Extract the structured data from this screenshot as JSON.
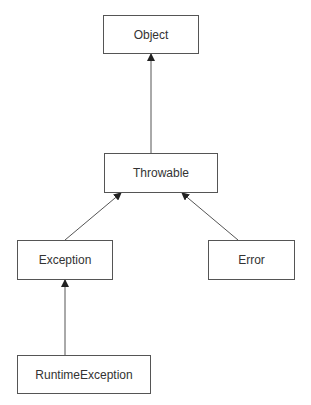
{
  "diagram": {
    "type": "class-hierarchy",
    "nodes": [
      {
        "id": "object",
        "label": "Object"
      },
      {
        "id": "throwable",
        "label": "Throwable"
      },
      {
        "id": "exception",
        "label": "Exception"
      },
      {
        "id": "error",
        "label": "Error"
      },
      {
        "id": "runtime",
        "label": "RuntimeException"
      }
    ],
    "edges": [
      {
        "from": "throwable",
        "to": "object",
        "kind": "inherits"
      },
      {
        "from": "exception",
        "to": "throwable",
        "kind": "inherits"
      },
      {
        "from": "error",
        "to": "throwable",
        "kind": "inherits"
      },
      {
        "from": "runtime",
        "to": "exception",
        "kind": "inherits"
      }
    ],
    "colors": {
      "line": "#555555",
      "text": "#333333",
      "background": "#ffffff"
    }
  }
}
